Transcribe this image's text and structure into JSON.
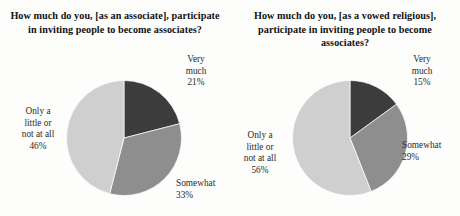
{
  "colors": {
    "background": "#fdfdfc",
    "text": "#1a1a1a",
    "very_much": "#3c3c3c",
    "somewhat": "#8e8e8e",
    "little_or_none": "#cfcfcf",
    "slice_outline": "#ffffff"
  },
  "charts": [
    {
      "id": "associate",
      "title": "How much do you, [as an associate], participate in inviting people to become associates?",
      "labels": {
        "very_much_name": "Very much",
        "very_much_line1": "Very",
        "very_much_line2": "much",
        "very_much_pct": "21%",
        "somewhat_name": "Somewhat",
        "somewhat_pct": "33%",
        "little_line1": "Only a",
        "little_line2": "little or",
        "little_line3": "not at all",
        "little_pct": "46%"
      }
    },
    {
      "id": "vowed-religious",
      "title": "How much do you, [as a vowed religious], participate in inviting people to become associates?",
      "labels": {
        "very_much_name": "Very much",
        "very_much_line1": "Very",
        "very_much_line2": "much",
        "very_much_pct": "15%",
        "somewhat_name": "Somewhat",
        "somewhat_pct": "29%",
        "little_line1": "Only a",
        "little_line2": "little or",
        "little_line3": "not at all",
        "little_pct": "56%"
      }
    }
  ],
  "chart_data": [
    {
      "type": "pie",
      "title": "How much do you, [as an associate], participate in inviting people to become associates?",
      "categories": [
        "Very much",
        "Somewhat",
        "Only a little or not at all"
      ],
      "values": [
        21,
        33,
        46
      ],
      "value_unit": "percent",
      "data_labels": [
        "21%",
        "33%",
        "46%"
      ],
      "colors": [
        "#3c3c3c",
        "#8e8e8e",
        "#cfcfcf"
      ],
      "start_angle_deg": 0,
      "direction": "clockwise",
      "legend": "outside-labels",
      "xlabel": "",
      "ylabel": ""
    },
    {
      "type": "pie",
      "title": "How much do you, [as a vowed religious], participate in inviting people to become associates?",
      "categories": [
        "Very much",
        "Somewhat",
        "Only a little or not at all"
      ],
      "values": [
        15,
        29,
        56
      ],
      "value_unit": "percent",
      "data_labels": [
        "15%",
        "29%",
        "56%"
      ],
      "colors": [
        "#3c3c3c",
        "#8e8e8e",
        "#cfcfcf"
      ],
      "start_angle_deg": 0,
      "direction": "clockwise",
      "legend": "outside-labels",
      "xlabel": "",
      "ylabel": ""
    }
  ]
}
